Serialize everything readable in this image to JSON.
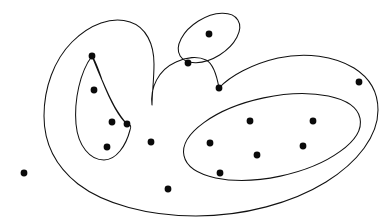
{
  "figure": {
    "kind": "set-diagram",
    "width": 388,
    "height": 223,
    "background_color": "#ffffff",
    "stroke_color": "#111111",
    "point_color": "#0a0a0a",
    "stroke_width": 1.05,
    "point_radius": 3.4
  },
  "chart_data": {
    "type": "scatter",
    "xlabel": "",
    "ylabel": "",
    "xlim": [
      0,
      388
    ],
    "ylim": [
      0,
      223
    ],
    "grid": false,
    "legend": "none",
    "regions": [
      {
        "name": "outer-region",
        "label": "outer crescent region",
        "shape": "closed-curve-concave",
        "path": "M 152 105 C 150 88 158 70 176 62 C 186 57 198 56 206 60 C 212 63 216 71 219 88 C 230 76 252 64 278 58 C 306 52 334 56 354 68 C 370 78 378 92 378 110 C 378 136 358 162 326 182 C 292 203 244 216 196 216 C 148 216 104 204 78 184 C 54 165 44 141 44 116 C 44 88 54 60 72 42 C 90 24 112 16 130 22 C 146 27 154 44 154 64 C 154 80 152 94 152 105 Z"
      },
      {
        "name": "top-small-ellipse",
        "label": "small upper ellipse",
        "shape": "ellipse",
        "cx": 209,
        "cy": 38,
        "rx": 34,
        "ry": 20,
        "rotation": -32
      },
      {
        "name": "left-inner-region",
        "label": "left leaf shaped inner region",
        "shape": "closed-curve-cusp",
        "path": "M 92 56 C 80 72 74 100 76 124 C 78 146 90 160 104 160 C 116 160 126 146 130 130 C 132 126 130 124 127 124 C 120 118 110 100 102 80 C 98 68 95 60 92 56 Z M 92 56 C 96 66 104 86 113 104 C 120 116 125 122 127 124"
      },
      {
        "name": "right-inner-ellipse",
        "label": "right inner ellipse",
        "shape": "ellipse",
        "cx": 272,
        "cy": 137,
        "rx": 90,
        "ry": 40,
        "rotation": -12
      }
    ],
    "points": [
      {
        "id": "p1",
        "x": 24,
        "y": 173,
        "label": "isolated exterior point",
        "region": "exterior",
        "on_boundary": false
      },
      {
        "id": "p2",
        "x": 92,
        "y": 56,
        "label": "left inner top cusp point",
        "region": "left-inner-region",
        "on_boundary": true
      },
      {
        "id": "p3",
        "x": 94,
        "y": 90,
        "label": "left inner upper point",
        "region": "left-inner-region",
        "on_boundary": false
      },
      {
        "id": "p4",
        "x": 112,
        "y": 122,
        "label": "left inner middle point",
        "region": "left-inner-region",
        "on_boundary": false
      },
      {
        "id": "p5",
        "x": 127,
        "y": 124,
        "label": "left inner right cusp point",
        "region": "left-inner-region",
        "on_boundary": true
      },
      {
        "id": "p6",
        "x": 107,
        "y": 147,
        "label": "left inner lower point",
        "region": "left-inner-region",
        "on_boundary": false
      },
      {
        "id": "p7",
        "x": 151,
        "y": 142,
        "label": "outer region interior point",
        "region": "outer-region",
        "on_boundary": false
      },
      {
        "id": "p8",
        "x": 168,
        "y": 189,
        "label": "outer region bottom point",
        "region": "outer-region",
        "on_boundary": false
      },
      {
        "id": "p9",
        "x": 209,
        "y": 34,
        "label": "upper ellipse interior point",
        "region": "top-small-ellipse",
        "on_boundary": false
      },
      {
        "id": "p10",
        "x": 188,
        "y": 63,
        "label": "upper ellipse boundary point",
        "region": "top-small-ellipse",
        "on_boundary": true
      },
      {
        "id": "p11",
        "x": 219,
        "y": 88,
        "label": "outer boundary neck point",
        "region": "outer-region",
        "on_boundary": true
      },
      {
        "id": "p12",
        "x": 359,
        "y": 82,
        "label": "outer boundary right point",
        "region": "outer-region",
        "on_boundary": true
      },
      {
        "id": "p13",
        "x": 250,
        "y": 121,
        "label": "right ellipse upper-left point",
        "region": "right-inner-ellipse",
        "on_boundary": false
      },
      {
        "id": "p14",
        "x": 313,
        "y": 121,
        "label": "right ellipse upper-right point",
        "region": "right-inner-ellipse",
        "on_boundary": false
      },
      {
        "id": "p15",
        "x": 210,
        "y": 143,
        "label": "right ellipse left point",
        "region": "right-inner-ellipse",
        "on_boundary": false
      },
      {
        "id": "p16",
        "x": 257,
        "y": 155,
        "label": "right ellipse lower-middle point",
        "region": "right-inner-ellipse",
        "on_boundary": false
      },
      {
        "id": "p17",
        "x": 303,
        "y": 146,
        "label": "right ellipse lower-right point",
        "region": "right-inner-ellipse",
        "on_boundary": false
      },
      {
        "id": "p18",
        "x": 220,
        "y": 173,
        "label": "right ellipse boundary bottom point",
        "region": "right-inner-ellipse",
        "on_boundary": true
      }
    ]
  }
}
